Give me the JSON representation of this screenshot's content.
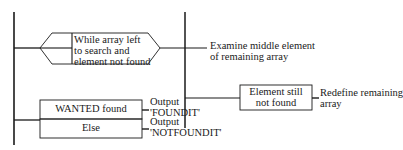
{
  "diagram": {
    "loop_condition": [
      "While array left",
      "to search and",
      "element not found"
    ],
    "loop_action": [
      "Examine middle element",
      "of remaining array"
    ],
    "inner_condition": [
      "Element still",
      "not found"
    ],
    "inner_action": [
      "Redefine remaining",
      "array"
    ],
    "select_found": {
      "condition": "WANTED found",
      "action": [
        "Output",
        "'FOUNDIT'"
      ]
    },
    "select_else": {
      "condition": "Else",
      "action": [
        "Output",
        "'NOTFOUNDIT'"
      ]
    }
  }
}
